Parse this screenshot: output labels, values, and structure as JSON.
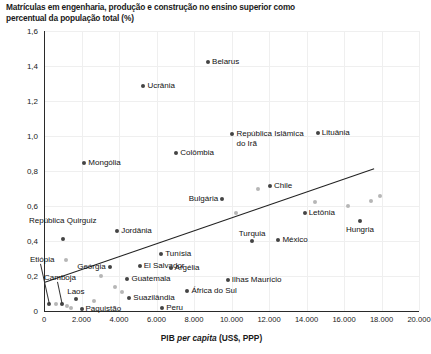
{
  "title": "Matrículas em engenharia, produção e construção no ensino superior como percentual da população total (%)",
  "axes": {
    "x_title_main": "PIB ",
    "x_title_em": "per capita",
    "x_title_tail": " (US$, PPP)",
    "y_ticks": [
      "0",
      "0,2",
      "0,4",
      "0,6",
      "0,8",
      "1,0",
      "1,2",
      "1,4",
      "1,6"
    ],
    "x_ticks": [
      "0",
      "2.000",
      "4.000",
      "6.000",
      "8.000",
      "10.000",
      "12.000",
      "14.000",
      "16.000",
      "18.000",
      "20.000"
    ]
  },
  "chart_data": {
    "type": "scatter",
    "title": "Matrículas em engenharia, produção e construção no ensino superior como percentual da população total (%)",
    "xlabel": "PIB per capita (US$, PPP)",
    "ylabel": "Matrículas em engenharia, produção e construção no ensino superior como percentual da população total (%)",
    "xlim": [
      0,
      20000
    ],
    "ylim": [
      0,
      1.6
    ],
    "grid": true,
    "legend": "none",
    "trendline": {
      "x0": 0,
      "y0": 0.165,
      "x1": 17600,
      "y1": 0.815
    },
    "points": [
      {
        "label": "Belarus",
        "x": 8750,
        "y": 1.425,
        "label_pos": "right"
      },
      {
        "label": "Ucrânia",
        "x": 5300,
        "y": 1.285,
        "label_pos": "right"
      },
      {
        "label": "República Islâmica do Irã",
        "x": 10050,
        "y": 1.01,
        "label_pos": "right-two"
      },
      {
        "label": "Lituânia",
        "x": 14600,
        "y": 1.02,
        "label_pos": "right"
      },
      {
        "label": "Colômbia",
        "x": 7050,
        "y": 0.905,
        "label_pos": "right"
      },
      {
        "label": "Mongólia",
        "x": 2150,
        "y": 0.845,
        "label_pos": "right"
      },
      {
        "label": "Chile",
        "x": 12050,
        "y": 0.715,
        "label_pos": "right"
      },
      {
        "label": "Bulgária",
        "x": 9500,
        "y": 0.64,
        "label_pos": "left"
      },
      {
        "label": "Letônia",
        "x": 13900,
        "y": 0.56,
        "label_pos": "right"
      },
      {
        "label": "Hungria",
        "x": 16850,
        "y": 0.515,
        "label_pos": "below"
      },
      {
        "label": "República Quirguiz",
        "x": 1000,
        "y": 0.41,
        "label_pos": "above-two"
      },
      {
        "label": "Jordânia",
        "x": 3900,
        "y": 0.46,
        "label_pos": "right"
      },
      {
        "label": "Turquia",
        "x": 11100,
        "y": 0.4,
        "label_pos": "above"
      },
      {
        "label": "México",
        "x": 12500,
        "y": 0.405,
        "label_pos": "right"
      },
      {
        "label": "Tunísia",
        "x": 6250,
        "y": 0.325,
        "label_pos": "right"
      },
      {
        "label": "Etiópia",
        "x": 260,
        "y": 0.04,
        "label_pos": "leader-up"
      },
      {
        "label": "Geórgia",
        "x": 3500,
        "y": 0.25,
        "label_pos": "left"
      },
      {
        "label": "El Salvador",
        "x": 5100,
        "y": 0.255,
        "label_pos": "right"
      },
      {
        "label": "Argélia",
        "x": 6750,
        "y": 0.245,
        "label_pos": "right"
      },
      {
        "label": "Camboja",
        "x": 940,
        "y": 0.04,
        "label_pos": "leader-up"
      },
      {
        "label": "Guatemala",
        "x": 4450,
        "y": 0.185,
        "label_pos": "right"
      },
      {
        "label": "Ilhas Maurício",
        "x": 9800,
        "y": 0.175,
        "label_pos": "right"
      },
      {
        "label": "África do Sul",
        "x": 7650,
        "y": 0.115,
        "label_pos": "right"
      },
      {
        "label": "Laos",
        "x": 1700,
        "y": 0.07,
        "label_pos": "above"
      },
      {
        "label": "Suazilândia",
        "x": 4550,
        "y": 0.075,
        "label_pos": "right"
      },
      {
        "label": "Paquistão",
        "x": 2000,
        "y": 0.01,
        "label_pos": "right"
      },
      {
        "label": "Peru",
        "x": 6300,
        "y": 0.02,
        "label_pos": "right"
      }
    ],
    "unlabeled_points": [
      {
        "x": 14450,
        "y": 0.625,
        "shade": "light"
      },
      {
        "x": 16200,
        "y": 0.6,
        "shade": "light"
      },
      {
        "x": 17450,
        "y": 0.63,
        "shade": "light"
      },
      {
        "x": 17900,
        "y": 0.655,
        "shade": "light"
      },
      {
        "x": 11400,
        "y": 0.7,
        "shade": "light"
      },
      {
        "x": 10250,
        "y": 0.56,
        "shade": "light"
      },
      {
        "x": 1150,
        "y": 0.29,
        "shade": "light"
      },
      {
        "x": 3050,
        "y": 0.2,
        "shade": "light"
      },
      {
        "x": 3800,
        "y": 0.14,
        "shade": "light"
      },
      {
        "x": 4150,
        "y": 0.11,
        "shade": "light"
      },
      {
        "x": 620,
        "y": 0.04,
        "shade": "light"
      },
      {
        "x": 1250,
        "y": 0.03,
        "shade": "light"
      },
      {
        "x": 1450,
        "y": 0.02,
        "shade": "light"
      },
      {
        "x": 2650,
        "y": 0.06,
        "shade": "light"
      }
    ]
  }
}
